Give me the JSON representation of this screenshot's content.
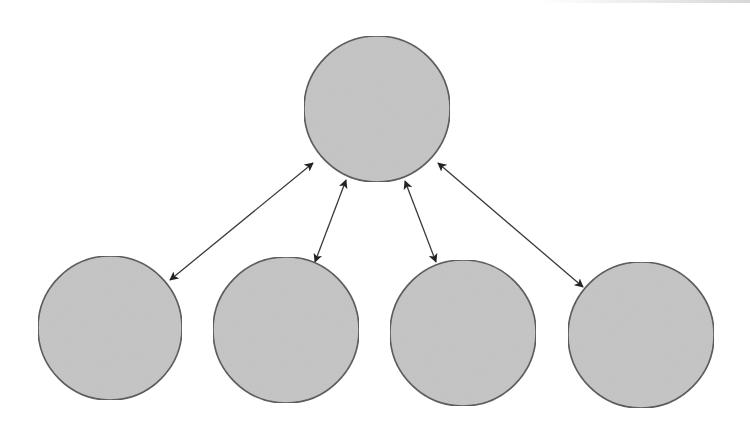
{
  "diagram": {
    "type": "hub-and-spoke",
    "colors": {
      "node_fill": "#c4c4c4",
      "node_stroke": "#555555",
      "edge_stroke": "#3a3a3a",
      "background": "#ffffff"
    },
    "nodes": [
      {
        "id": "hub",
        "label": "",
        "cx": 377,
        "cy": 109,
        "r": 73
      },
      {
        "id": "child-1",
        "label": "",
        "cx": 110,
        "cy": 328,
        "r": 72
      },
      {
        "id": "child-2",
        "label": "",
        "cx": 286,
        "cy": 330,
        "r": 73
      },
      {
        "id": "child-3",
        "label": "",
        "cx": 463,
        "cy": 333,
        "r": 73
      },
      {
        "id": "child-4",
        "label": "",
        "cx": 641,
        "cy": 335,
        "r": 73
      }
    ],
    "edges": [
      {
        "from": "hub",
        "to": "child-1",
        "direction": "both",
        "x1": 313,
        "y1": 163,
        "x2": 170,
        "y2": 280
      },
      {
        "from": "hub",
        "to": "child-2",
        "direction": "both",
        "x1": 346,
        "y1": 180,
        "x2": 315,
        "y2": 262
      },
      {
        "from": "hub",
        "to": "child-3",
        "direction": "both",
        "x1": 405,
        "y1": 181,
        "x2": 436,
        "y2": 262
      },
      {
        "from": "hub",
        "to": "child-4",
        "direction": "both",
        "x1": 438,
        "y1": 163,
        "x2": 583,
        "y2": 287
      }
    ]
  }
}
